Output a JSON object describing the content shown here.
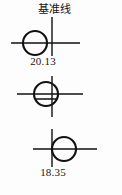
{
  "diagram": {
    "title_label": "基准线",
    "background_color": "#fdfdfd",
    "line_color": "#111111",
    "figures": [
      {
        "id": "figure-top",
        "name": "circle-right-of-datum",
        "dimension_value": "20.13",
        "dimension_position": "below",
        "circle": {
          "cx": 35,
          "cy": 43,
          "r": 12
        },
        "horizontal_line": {
          "x1": 11,
          "x2": 80,
          "y": 43
        },
        "datum_line": {
          "x": 52,
          "y1": 17,
          "y2": 55
        },
        "chord": null
      },
      {
        "id": "figure-middle",
        "name": "circle-centered-on-datum",
        "dimension_value": "",
        "dimension_position": "none",
        "circle": {
          "cx": 46,
          "cy": 94,
          "r": 12
        },
        "horizontal_line": {
          "x1": 17,
          "x2": 83,
          "y": 94
        },
        "datum_line": {
          "x": 52,
          "y1": 76,
          "y2": 116
        },
        "chord": {
          "x1": 36,
          "x2": 57,
          "y": 99
        }
      },
      {
        "id": "figure-bottom",
        "name": "circle-left-of-datum",
        "dimension_value": "18.35",
        "dimension_position": "below",
        "circle": {
          "cx": 64,
          "cy": 149,
          "r": 12
        },
        "horizontal_line": {
          "x1": 33,
          "x2": 97,
          "y": 149
        },
        "datum_line": {
          "x": 52,
          "y1": 129,
          "y2": 166
        },
        "chord": null
      }
    ]
  }
}
